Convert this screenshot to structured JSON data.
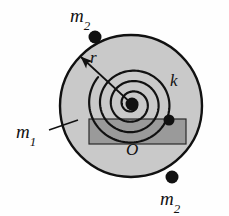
{
  "figure": {
    "background_color": "#fefefe"
  },
  "disk": {
    "name": "m1",
    "label_main": "m",
    "label_sub": "1",
    "center_x": 131,
    "center_y": 106,
    "radius": 71,
    "fill_color": "#c9c9c9",
    "stroke_color": "#111111",
    "stroke_width": 2.4
  },
  "spiral_spring": {
    "name": "k",
    "label_main": "k",
    "label_sub": "",
    "turns": 3.6,
    "center_x": 132,
    "center_y": 104,
    "inner_radius": 5,
    "outer_radius": 44,
    "stroke_color": "#111111",
    "stroke_width": 2.2
  },
  "hub": {
    "center_x": 132,
    "center_y": 104,
    "radius": 6.5,
    "fill_color": "#111111"
  },
  "bar": {
    "x": 89,
    "y": 119,
    "width": 97,
    "height": 25,
    "fill_color": "#9a9a9a",
    "stroke_color": "#2a2a2a",
    "stroke_width": 1.2
  },
  "anchor_dot": {
    "center_x": 169,
    "center_y": 120,
    "radius": 5.5,
    "fill_color": "#111111"
  },
  "radius_arrow": {
    "label_main": "r",
    "label_sub": "",
    "from_x": 132,
    "from_y": 104,
    "to_x": 81,
    "to_y": 57,
    "stroke_color": "#111111",
    "stroke_width": 1.7
  },
  "origin": {
    "label_main": "O",
    "label_sub": "",
    "x": 133,
    "y": 152
  },
  "leader_line_m1": {
    "from_x": 49,
    "from_y": 130,
    "to_x": 78,
    "to_y": 120,
    "stroke_color": "#111111",
    "stroke_width": 1.4
  },
  "rim_masses": [
    {
      "id": "m2-top",
      "label_main": "m",
      "label_sub": "2",
      "center_x": 95,
      "center_y": 37,
      "radius": 6.5,
      "fill_color": "#111111"
    },
    {
      "id": "m2-bottom-right",
      "label_main": "m",
      "label_sub": "2",
      "center_x": 172,
      "center_y": 177,
      "radius": 6.5,
      "fill_color": "#111111"
    },
    {
      "id": "m2-right",
      "label_main": "m",
      "label_sub": "2",
      "center_x": 169,
      "center_y": 120,
      "radius": 5.5,
      "fill_color": "#111111"
    }
  ],
  "colors": {
    "disk_gray": "#c9c9c9",
    "bar_gray": "#9a9a9a",
    "ink": "#111111",
    "page": "#fefefe"
  }
}
